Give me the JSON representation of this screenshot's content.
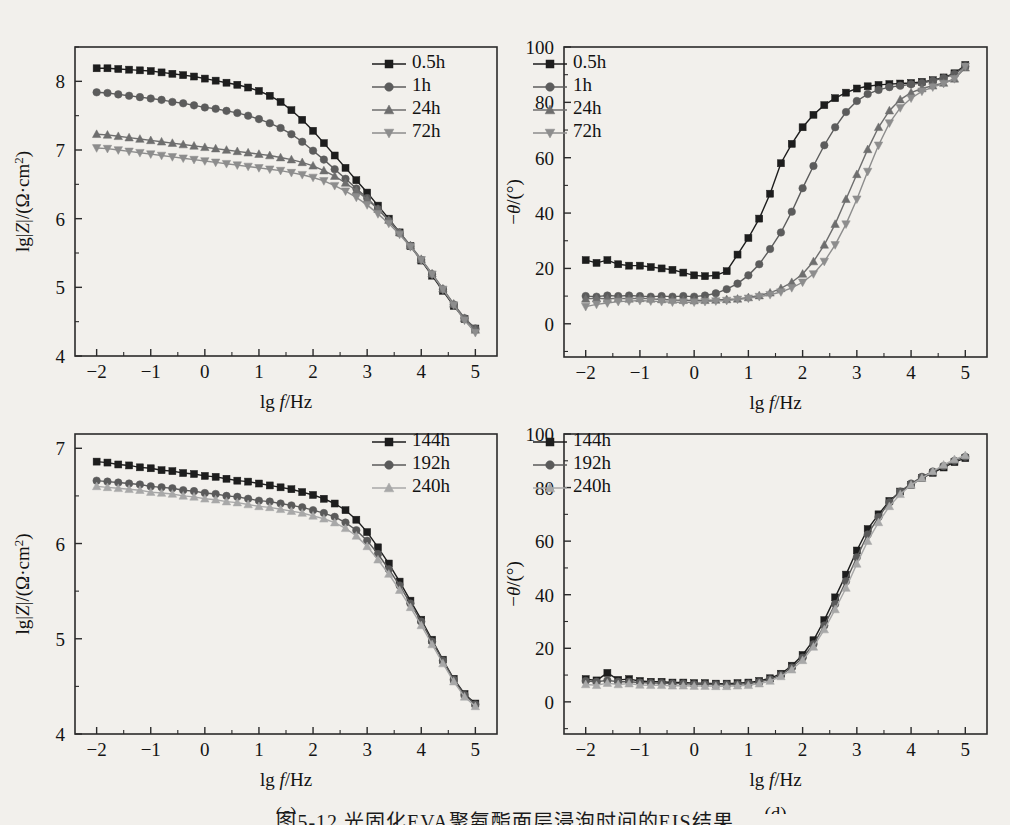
{
  "figure": {
    "background": "#f2f0ec",
    "caption": "图5-12  光固化EVA聚氨酯面层浸泡时间的EIS结果"
  },
  "colors": {
    "series_1": "#1d1d1d",
    "series_2": "#5c5c5c",
    "series_3": "#6e6e6e",
    "series_4": "#8d8d8d",
    "series_c1": "#1d1d1d",
    "series_c2": "#5a5a5a",
    "series_c3": "#a8a8a8",
    "axis": "#2b2b2b",
    "text": "#141414"
  },
  "axis_titles": {
    "x": "lg f/Hz",
    "x_prefix": "lg ",
    "x_italic": "f",
    "x_suffix": "/Hz",
    "y_magnitude": "lg|Z|/(Ω·cm²)",
    "y_phase": "−θ/(°)"
  },
  "chart_data": [
    {
      "id": "panel-a",
      "type": "line",
      "caption": "(a)",
      "title": "",
      "xlabel": "lg f/Hz",
      "ylabel": "lg|Z|/(Ω·cm²)",
      "xlim": [
        -2.4,
        5.4
      ],
      "ylim": [
        4,
        8.5
      ],
      "xticks": [
        -2,
        -1,
        0,
        1,
        2,
        3,
        4,
        5
      ],
      "xticklabels": [
        "−2",
        "−1",
        "0",
        "1",
        "2",
        "3",
        "4",
        "5"
      ],
      "yticks": [
        4,
        5,
        6,
        7,
        8
      ],
      "yticklabels": [
        "4",
        "5",
        "6",
        "7",
        "8"
      ],
      "grid": false,
      "legend_position": "top-right",
      "x": [
        -2.0,
        -1.8,
        -1.6,
        -1.4,
        -1.2,
        -1.0,
        -0.8,
        -0.6,
        -0.4,
        -0.2,
        0.0,
        0.2,
        0.4,
        0.6,
        0.8,
        1.0,
        1.2,
        1.4,
        1.6,
        1.8,
        2.0,
        2.2,
        2.4,
        2.6,
        2.8,
        3.0,
        3.2,
        3.4,
        3.6,
        3.8,
        4.0,
        4.2,
        4.4,
        4.6,
        4.8,
        5.0
      ],
      "series": [
        {
          "name": "0.5h",
          "marker": "square",
          "color": "#1d1d1d",
          "values": [
            8.19,
            8.19,
            8.18,
            8.17,
            8.16,
            8.15,
            8.13,
            8.11,
            8.09,
            8.07,
            8.04,
            8.01,
            7.98,
            7.95,
            7.91,
            7.86,
            7.79,
            7.7,
            7.58,
            7.44,
            7.28,
            7.1,
            6.92,
            6.74,
            6.56,
            6.38,
            6.19,
            6.0,
            5.8,
            5.6,
            5.39,
            5.17,
            4.95,
            4.73,
            4.54,
            4.4
          ]
        },
        {
          "name": "1h",
          "marker": "circle",
          "color": "#5c5c5c",
          "values": [
            7.84,
            7.83,
            7.81,
            7.79,
            7.77,
            7.75,
            7.73,
            7.7,
            7.68,
            7.65,
            7.62,
            7.6,
            7.57,
            7.54,
            7.5,
            7.45,
            7.39,
            7.32,
            7.23,
            7.12,
            6.99,
            6.86,
            6.72,
            6.58,
            6.44,
            6.3,
            6.14,
            5.97,
            5.79,
            5.6,
            5.4,
            5.19,
            4.97,
            4.75,
            4.55,
            4.4
          ]
        },
        {
          "name": "24h",
          "marker": "triangle-up",
          "color": "#6e6e6e",
          "values": [
            7.23,
            7.22,
            7.2,
            7.18,
            7.16,
            7.14,
            7.12,
            7.1,
            7.08,
            7.06,
            7.04,
            7.02,
            7.0,
            6.98,
            6.96,
            6.94,
            6.92,
            6.89,
            6.86,
            6.82,
            6.77,
            6.7,
            6.62,
            6.52,
            6.41,
            6.28,
            6.14,
            5.98,
            5.8,
            5.61,
            5.41,
            5.2,
            4.98,
            4.76,
            4.55,
            4.38
          ]
        },
        {
          "name": "72h",
          "marker": "triangle-down",
          "color": "#8d8d8d",
          "values": [
            7.03,
            7.02,
            7.0,
            6.98,
            6.96,
            6.94,
            6.92,
            6.9,
            6.88,
            6.86,
            6.84,
            6.82,
            6.8,
            6.78,
            6.76,
            6.74,
            6.72,
            6.7,
            6.67,
            6.64,
            6.6,
            6.55,
            6.48,
            6.4,
            6.31,
            6.2,
            6.07,
            5.93,
            5.77,
            5.59,
            5.4,
            5.19,
            4.97,
            4.74,
            4.52,
            4.34
          ]
        }
      ]
    },
    {
      "id": "panel-b",
      "type": "line",
      "caption": "(b)",
      "title": "",
      "xlabel": "lg f/Hz",
      "ylabel": "−θ/(°)",
      "xlim": [
        -2.4,
        5.4
      ],
      "ylim": [
        -12,
        100
      ],
      "xticks": [
        -2,
        -1,
        0,
        1,
        2,
        3,
        4,
        5
      ],
      "xticklabels": [
        "−2",
        "−1",
        "0",
        "1",
        "2",
        "3",
        "4",
        "5"
      ],
      "yticks": [
        0,
        20,
        40,
        60,
        80,
        100
      ],
      "yticklabels": [
        "0",
        "20",
        "40",
        "60",
        "80",
        "100"
      ],
      "grid": false,
      "legend_position": "top-left",
      "x": [
        -2.0,
        -1.8,
        -1.6,
        -1.4,
        -1.2,
        -1.0,
        -0.8,
        -0.6,
        -0.4,
        -0.2,
        0.0,
        0.2,
        0.4,
        0.6,
        0.8,
        1.0,
        1.2,
        1.4,
        1.6,
        1.8,
        2.0,
        2.2,
        2.4,
        2.6,
        2.8,
        3.0,
        3.2,
        3.4,
        3.6,
        3.8,
        4.0,
        4.2,
        4.4,
        4.6,
        4.8,
        5.0
      ],
      "series": [
        {
          "name": "0.5h",
          "marker": "square",
          "color": "#1d1d1d",
          "values": [
            23.0,
            22.0,
            23.0,
            21.5,
            21.0,
            21.0,
            20.5,
            20.0,
            19.5,
            18.5,
            17.5,
            17.2,
            17.5,
            19.0,
            25.0,
            31.0,
            38.0,
            47.0,
            58.0,
            65.0,
            71.0,
            75.5,
            79.0,
            81.5,
            83.5,
            85.0,
            85.8,
            86.3,
            86.6,
            86.8,
            87.0,
            87.4,
            88.0,
            89.0,
            90.5,
            93.5
          ]
        },
        {
          "name": "1h",
          "marker": "circle",
          "color": "#5c5c5c",
          "values": [
            10.0,
            9.8,
            10.2,
            10.0,
            10.2,
            10.0,
            9.8,
            10.0,
            9.8,
            10.0,
            9.8,
            10.2,
            11.0,
            12.5,
            14.5,
            17.5,
            21.5,
            27.0,
            33.0,
            40.5,
            49.0,
            57.0,
            64.5,
            71.0,
            76.5,
            80.5,
            83.0,
            84.5,
            85.5,
            86.0,
            86.5,
            87.0,
            87.8,
            88.8,
            90.2,
            93.0
          ]
        },
        {
          "name": "24h",
          "marker": "triangle-up",
          "color": "#6e6e6e",
          "values": [
            9.0,
            9.2,
            9.0,
            9.2,
            9.0,
            9.2,
            9.0,
            8.8,
            8.6,
            8.5,
            8.4,
            8.5,
            8.6,
            8.8,
            9.0,
            9.5,
            10.2,
            11.2,
            12.8,
            15.0,
            18.0,
            22.5,
            28.5,
            36.0,
            45.0,
            54.0,
            63.0,
            71.0,
            77.0,
            81.0,
            83.5,
            85.0,
            86.0,
            87.0,
            88.5,
            92.5
          ]
        },
        {
          "name": "72h",
          "marker": "triangle-down",
          "color": "#8d8d8d",
          "values": [
            6.2,
            7.0,
            7.5,
            8.0,
            8.2,
            8.4,
            8.2,
            8.0,
            7.8,
            7.8,
            7.8,
            8.0,
            8.2,
            8.4,
            8.8,
            9.2,
            9.8,
            10.5,
            11.5,
            13.0,
            15.0,
            18.0,
            22.5,
            28.5,
            36.0,
            45.0,
            55.0,
            64.5,
            72.5,
            78.0,
            81.5,
            84.0,
            85.5,
            86.8,
            88.5,
            93.0
          ]
        }
      ]
    },
    {
      "id": "panel-c",
      "type": "line",
      "caption": "(c)",
      "title": "",
      "xlabel": "lg f/Hz",
      "ylabel": "lg|Z|/(Ω·cm²)",
      "xlim": [
        -2.4,
        5.4
      ],
      "ylim": [
        4,
        7.15
      ],
      "xticks": [
        -2,
        -1,
        0,
        1,
        2,
        3,
        4,
        5
      ],
      "xticklabels": [
        "−2",
        "−1",
        "0",
        "1",
        "2",
        "3",
        "4",
        "5"
      ],
      "yticks": [
        4,
        5,
        6,
        7
      ],
      "yticklabels": [
        "4",
        "5",
        "6",
        "7"
      ],
      "grid": false,
      "legend_position": "top-right",
      "x": [
        -2.0,
        -1.8,
        -1.6,
        -1.4,
        -1.2,
        -1.0,
        -0.8,
        -0.6,
        -0.4,
        -0.2,
        0.0,
        0.2,
        0.4,
        0.6,
        0.8,
        1.0,
        1.2,
        1.4,
        1.6,
        1.8,
        2.0,
        2.2,
        2.4,
        2.6,
        2.8,
        3.0,
        3.2,
        3.4,
        3.6,
        3.8,
        4.0,
        4.2,
        4.4,
        4.6,
        4.8,
        5.0
      ],
      "series": [
        {
          "name": "144h",
          "marker": "square",
          "color": "#1d1d1d",
          "values": [
            6.86,
            6.85,
            6.83,
            6.82,
            6.8,
            6.79,
            6.77,
            6.76,
            6.74,
            6.73,
            6.71,
            6.7,
            6.68,
            6.66,
            6.65,
            6.63,
            6.61,
            6.59,
            6.57,
            6.54,
            6.51,
            6.47,
            6.42,
            6.35,
            6.25,
            6.12,
            5.96,
            5.79,
            5.6,
            5.4,
            5.2,
            4.99,
            4.78,
            4.58,
            4.42,
            4.32
          ]
        },
        {
          "name": "192h",
          "marker": "circle",
          "color": "#5a5a5a",
          "values": [
            6.66,
            6.65,
            6.64,
            6.63,
            6.62,
            6.6,
            6.59,
            6.58,
            6.56,
            6.55,
            6.53,
            6.52,
            6.5,
            6.49,
            6.47,
            6.45,
            6.44,
            6.42,
            6.4,
            6.38,
            6.35,
            6.32,
            6.28,
            6.22,
            6.14,
            6.03,
            5.89,
            5.73,
            5.56,
            5.37,
            5.18,
            4.97,
            4.77,
            4.57,
            4.41,
            4.31
          ]
        },
        {
          "name": "240h",
          "marker": "triangle-up",
          "color": "#a8a8a8",
          "values": [
            6.6,
            6.59,
            6.58,
            6.57,
            6.56,
            6.54,
            6.53,
            6.52,
            6.5,
            6.49,
            6.47,
            6.46,
            6.44,
            6.43,
            6.41,
            6.39,
            6.38,
            6.36,
            6.34,
            6.32,
            6.29,
            6.26,
            6.22,
            6.16,
            6.08,
            5.97,
            5.83,
            5.68,
            5.51,
            5.33,
            5.14,
            4.94,
            4.74,
            4.55,
            4.39,
            4.29
          ]
        }
      ]
    },
    {
      "id": "panel-d",
      "type": "line",
      "caption": "(d)",
      "title": "",
      "xlabel": "lg f/Hz",
      "ylabel": "−θ/(°)",
      "xlim": [
        -2.4,
        5.4
      ],
      "ylim": [
        -12,
        100
      ],
      "xticks": [
        -2,
        -1,
        0,
        1,
        2,
        3,
        4,
        5
      ],
      "xticklabels": [
        "−2",
        "−1",
        "0",
        "1",
        "2",
        "3",
        "4",
        "5"
      ],
      "yticks": [
        0,
        20,
        40,
        60,
        80,
        100
      ],
      "yticklabels": [
        "0",
        "20",
        "40",
        "60",
        "80",
        "100"
      ],
      "grid": false,
      "legend_position": "top-left",
      "x": [
        -2.0,
        -1.8,
        -1.6,
        -1.4,
        -1.2,
        -1.0,
        -0.8,
        -0.6,
        -0.4,
        -0.2,
        0.0,
        0.2,
        0.4,
        0.6,
        0.8,
        1.0,
        1.2,
        1.4,
        1.6,
        1.8,
        2.0,
        2.2,
        2.4,
        2.6,
        2.8,
        3.0,
        3.2,
        3.4,
        3.6,
        3.8,
        4.0,
        4.2,
        4.4,
        4.6,
        4.8,
        5.0
      ],
      "series": [
        {
          "name": "144h",
          "marker": "square",
          "color": "#1d1d1d",
          "values": [
            8.5,
            8.0,
            10.8,
            8.2,
            8.5,
            7.8,
            7.5,
            7.5,
            7.2,
            7.2,
            7.0,
            7.0,
            6.8,
            6.8,
            7.0,
            7.2,
            7.8,
            8.8,
            10.5,
            13.5,
            17.5,
            23.0,
            30.5,
            39.0,
            47.5,
            56.5,
            64.5,
            70.0,
            75.0,
            78.5,
            81.0,
            83.5,
            85.5,
            87.5,
            89.5,
            91.0
          ]
        },
        {
          "name": "192h",
          "marker": "circle",
          "color": "#5a5a5a",
          "values": [
            7.8,
            7.5,
            8.0,
            7.5,
            7.5,
            7.2,
            7.0,
            7.0,
            6.8,
            6.8,
            6.6,
            6.6,
            6.5,
            6.5,
            6.6,
            6.8,
            7.4,
            8.4,
            10.0,
            12.8,
            16.5,
            21.5,
            28.5,
            36.5,
            45.0,
            54.0,
            62.5,
            69.0,
            74.5,
            78.5,
            81.5,
            84.0,
            86.0,
            88.0,
            90.0,
            91.5
          ]
        },
        {
          "name": "240h",
          "marker": "triangle-up",
          "color": "#a8a8a8",
          "values": [
            6.5,
            6.2,
            7.0,
            6.5,
            6.8,
            6.3,
            6.2,
            6.2,
            6.0,
            6.0,
            5.9,
            5.9,
            5.8,
            5.8,
            6.0,
            6.2,
            6.8,
            7.8,
            9.5,
            12.0,
            15.5,
            20.5,
            27.0,
            34.5,
            42.5,
            51.5,
            60.0,
            67.0,
            73.0,
            77.5,
            81.0,
            83.5,
            86.0,
            88.5,
            90.5,
            92.0
          ]
        }
      ]
    }
  ]
}
